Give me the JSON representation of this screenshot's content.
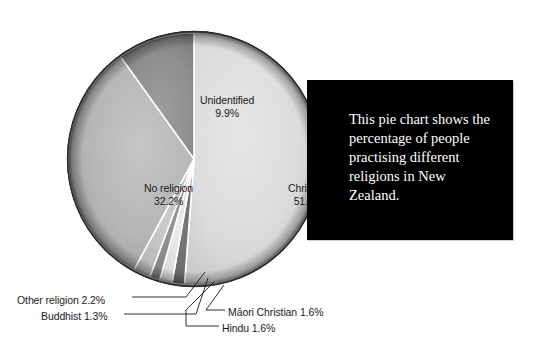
{
  "chart_data": {
    "type": "pie",
    "title": "",
    "subtitle": "",
    "xlabel": "",
    "ylabel": "",
    "legend_position": "none",
    "grid": false,
    "units": "percent",
    "start_angle_deg": 0,
    "direction": "clockwise",
    "categories": [
      "Christian",
      "Māori Christian",
      "Hindu",
      "Buddhist",
      "Other religion",
      "No religion",
      "Unidentified"
    ],
    "values": [
      51.2,
      1.6,
      1.6,
      1.3,
      2.2,
      32.2,
      9.9
    ],
    "slices": [
      {
        "name": "Christian",
        "label": "Christian",
        "percent": 51.2,
        "percent_text": "51.2%",
        "color": "#d9d9d9",
        "start_deg": 0.0,
        "end_deg": 184.32,
        "label_placement": "inside"
      },
      {
        "name": "Māori Christian",
        "label": "Māori Christian 1.6%",
        "percent": 1.6,
        "percent_text": "1.6%",
        "color": "#6f6f6f",
        "start_deg": 184.32,
        "end_deg": 190.08,
        "label_placement": "callout"
      },
      {
        "name": "Hindu",
        "label": "Hindu 1.6%",
        "percent": 1.6,
        "percent_text": "1.6%",
        "color": "#e2e2e2",
        "start_deg": 190.08,
        "end_deg": 195.84,
        "label_placement": "callout"
      },
      {
        "name": "Buddhist",
        "label": "Buddhist 1.3%",
        "percent": 1.3,
        "percent_text": "1.3%",
        "color": "#8a8a8a",
        "start_deg": 195.84,
        "end_deg": 200.52,
        "label_placement": "callout"
      },
      {
        "name": "Other religion",
        "label": "Other religion 2.2%",
        "percent": 2.2,
        "percent_text": "2.2%",
        "color": "#bdbdbd",
        "start_deg": 200.52,
        "end_deg": 208.44,
        "label_placement": "callout"
      },
      {
        "name": "No religion",
        "label": "No religion",
        "percent": 32.2,
        "percent_text": "32.2%",
        "color": "#b4b4b4",
        "start_deg": 208.44,
        "end_deg": 324.36,
        "label_placement": "inside"
      },
      {
        "name": "Unidentified",
        "label": "Unidentified",
        "percent": 9.9,
        "percent_text": "9.9%",
        "color": "#8e8e8e",
        "start_deg": 324.36,
        "end_deg": 360.0,
        "label_placement": "inside"
      }
    ]
  },
  "pie": {
    "labels": {
      "christian": {
        "name": "Christian",
        "percent": "51.2%"
      },
      "no_religion": {
        "name": "No religion",
        "percent": "32.2%"
      },
      "unidentified": {
        "name": "Unidentified",
        "percent": "9.9%"
      }
    },
    "callouts": {
      "other_religion": "Other religion 2.2%",
      "buddhist": "Buddhist 1.3%",
      "hindu": "Hindu 1.6%",
      "maori_christian": "Māori Christian 1.6%"
    }
  },
  "caption": {
    "text": "This pie chart shows the percentage of people practising different religions in New Zealand.",
    "background_color": "#000000",
    "text_color": "#ffffff"
  }
}
